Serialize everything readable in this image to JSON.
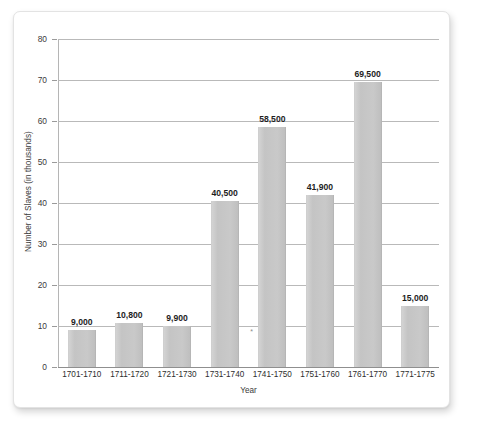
{
  "chart_data": {
    "type": "bar",
    "title": "",
    "xlabel": "Year",
    "ylabel": "Number of Slaves (in thousands)",
    "categories": [
      "1701-1710",
      "1711-1720",
      "1721-1730",
      "1731-1740",
      "1741-1750",
      "1751-1760",
      "1761-1770",
      "1771-1775"
    ],
    "values": [
      9,
      10.8,
      9.9,
      40.5,
      58.5,
      41.9,
      69.5,
      15
    ],
    "data_labels": [
      "9,000",
      "10,800",
      "9,900",
      "40,500",
      "58,500",
      "41,900",
      "69,500",
      "15,000"
    ],
    "ylim": [
      0,
      80
    ],
    "yticks": [
      0,
      10,
      20,
      30,
      40,
      50,
      60,
      70,
      80
    ],
    "ytick_labels": [
      "0",
      "10",
      "20",
      "30",
      "40",
      "50",
      "60",
      "70",
      "80"
    ],
    "grid": true,
    "legend": null,
    "legend_position": "none",
    "annotations": [
      {
        "text": "*",
        "category": "1741-1750",
        "value": 9.5
      }
    ],
    "bar_color": "#c6c6c6",
    "gridline_color": "#b9b9b9",
    "text_color": "#2e2e2e"
  }
}
